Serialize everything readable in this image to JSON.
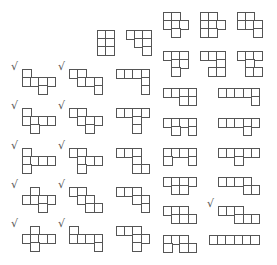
{
  "cell_size": 9.5,
  "line_color": "#555555",
  "check_glyph": "√",
  "pieces": [
    {
      "x": 22,
      "y": 69,
      "check": true,
      "cells": [
        [
          0,
          0
        ],
        [
          0,
          1
        ],
        [
          1,
          1
        ],
        [
          2,
          1
        ],
        [
          3,
          1
        ],
        [
          2,
          2
        ]
      ]
    },
    {
      "x": 22,
      "y": 108,
      "check": true,
      "cells": [
        [
          0,
          0
        ],
        [
          0,
          1
        ],
        [
          1,
          1
        ],
        [
          2,
          1
        ],
        [
          3,
          1
        ],
        [
          1,
          2
        ]
      ]
    },
    {
      "x": 22,
      "y": 148,
      "check": true,
      "cells": [
        [
          0,
          0
        ],
        [
          0,
          1
        ],
        [
          1,
          1
        ],
        [
          2,
          1
        ],
        [
          3,
          1
        ],
        [
          0,
          2
        ]
      ]
    },
    {
      "x": 22,
      "y": 187,
      "check": true,
      "cells": [
        [
          1,
          0
        ],
        [
          0,
          1
        ],
        [
          1,
          1
        ],
        [
          2,
          1
        ],
        [
          3,
          1
        ],
        [
          2,
          2
        ]
      ]
    },
    {
      "x": 22,
      "y": 226,
      "check": true,
      "cells": [
        [
          1,
          0
        ],
        [
          0,
          1
        ],
        [
          1,
          1
        ],
        [
          2,
          1
        ],
        [
          3,
          1
        ],
        [
          1,
          2
        ]
      ]
    },
    {
      "x": 69,
      "y": 69,
      "check": true,
      "cells": [
        [
          0,
          0
        ],
        [
          1,
          0
        ],
        [
          1,
          1
        ],
        [
          2,
          1
        ],
        [
          3,
          1
        ],
        [
          3,
          2
        ]
      ]
    },
    {
      "x": 69,
      "y": 108,
      "check": true,
      "cells": [
        [
          0,
          0
        ],
        [
          1,
          0
        ],
        [
          1,
          1
        ],
        [
          2,
          1
        ],
        [
          3,
          1
        ],
        [
          2,
          2
        ]
      ]
    },
    {
      "x": 69,
      "y": 148,
      "check": true,
      "cells": [
        [
          0,
          0
        ],
        [
          1,
          0
        ],
        [
          1,
          1
        ],
        [
          2,
          1
        ],
        [
          3,
          1
        ],
        [
          1,
          2
        ]
      ]
    },
    {
      "x": 69,
      "y": 187,
      "check": true,
      "cells": [
        [
          0,
          0
        ],
        [
          1,
          0
        ],
        [
          1,
          1
        ],
        [
          2,
          1
        ],
        [
          2,
          2
        ],
        [
          3,
          2
        ]
      ]
    },
    {
      "x": 69,
      "y": 226,
      "check": true,
      "cells": [
        [
          0,
          0
        ],
        [
          0,
          1
        ],
        [
          1,
          1
        ],
        [
          2,
          1
        ],
        [
          3,
          1
        ],
        [
          3,
          2
        ]
      ]
    },
    {
      "x": 97,
      "y": 30,
      "check": false,
      "cells": [
        [
          0,
          0
        ],
        [
          1,
          0
        ],
        [
          0,
          1
        ],
        [
          1,
          1
        ],
        [
          0,
          2
        ],
        [
          1,
          2
        ]
      ]
    },
    {
      "x": 126,
      "y": 30,
      "check": false,
      "cells": [
        [
          0,
          0
        ],
        [
          1,
          0
        ],
        [
          2,
          0
        ],
        [
          1,
          1
        ],
        [
          2,
          1
        ],
        [
          2,
          2
        ]
      ]
    },
    {
      "x": 116,
      "y": 69,
      "check": false,
      "cells": [
        [
          0,
          0
        ],
        [
          1,
          0
        ],
        [
          2,
          0
        ],
        [
          3,
          0
        ],
        [
          3,
          1
        ],
        [
          3,
          2
        ]
      ]
    },
    {
      "x": 116,
      "y": 108,
      "check": false,
      "cells": [
        [
          0,
          0
        ],
        [
          1,
          0
        ],
        [
          2,
          0
        ],
        [
          3,
          0
        ],
        [
          2,
          1
        ],
        [
          2,
          2
        ]
      ]
    },
    {
      "x": 116,
      "y": 148,
      "check": false,
      "cells": [
        [
          0,
          0
        ],
        [
          1,
          0
        ],
        [
          2,
          0
        ],
        [
          2,
          1
        ],
        [
          2,
          2
        ],
        [
          3,
          2
        ]
      ]
    },
    {
      "x": 116,
      "y": 187,
      "check": false,
      "cells": [
        [
          0,
          0
        ],
        [
          1,
          0
        ],
        [
          2,
          0
        ],
        [
          2,
          1
        ],
        [
          3,
          1
        ],
        [
          3,
          2
        ]
      ]
    },
    {
      "x": 116,
      "y": 226,
      "check": false,
      "cells": [
        [
          0,
          0
        ],
        [
          1,
          0
        ],
        [
          2,
          0
        ],
        [
          2,
          1
        ],
        [
          3,
          1
        ],
        [
          2,
          2
        ]
      ]
    },
    {
      "x": 163,
      "y": 12,
      "check": false,
      "cells": [
        [
          0,
          0
        ],
        [
          1,
          0
        ],
        [
          0,
          1
        ],
        [
          1,
          1
        ],
        [
          2,
          1
        ],
        [
          1,
          2
        ]
      ]
    },
    {
      "x": 163,
      "y": 51,
      "check": false,
      "cells": [
        [
          0,
          0
        ],
        [
          1,
          0
        ],
        [
          2,
          0
        ],
        [
          1,
          1
        ],
        [
          2,
          1
        ],
        [
          1,
          2
        ]
      ]
    },
    {
      "x": 163,
      "y": 88,
      "check": false,
      "cells": [
        [
          0,
          0
        ],
        [
          1,
          0
        ],
        [
          2,
          0
        ],
        [
          3,
          0
        ],
        [
          2,
          1
        ],
        [
          3,
          1
        ]
      ]
    },
    {
      "x": 163,
      "y": 118,
      "check": false,
      "cells": [
        [
          0,
          0
        ],
        [
          1,
          0
        ],
        [
          2,
          0
        ],
        [
          3,
          0
        ],
        [
          1,
          1
        ],
        [
          3,
          1
        ]
      ]
    },
    {
      "x": 163,
      "y": 148,
      "check": false,
      "cells": [
        [
          0,
          0
        ],
        [
          1,
          0
        ],
        [
          2,
          0
        ],
        [
          3,
          0
        ],
        [
          0,
          1
        ],
        [
          3,
          1
        ]
      ]
    },
    {
      "x": 163,
      "y": 177,
      "check": false,
      "cells": [
        [
          0,
          0
        ],
        [
          1,
          0
        ],
        [
          2,
          0
        ],
        [
          3,
          0
        ],
        [
          1,
          1
        ],
        [
          2,
          1
        ]
      ]
    },
    {
      "x": 163,
      "y": 206,
      "check": false,
      "cells": [
        [
          0,
          0
        ],
        [
          1,
          0
        ],
        [
          2,
          0
        ],
        [
          1,
          1
        ],
        [
          2,
          1
        ],
        [
          3,
          1
        ]
      ]
    },
    {
      "x": 163,
      "y": 235,
      "check": false,
      "cells": [
        [
          0,
          0
        ],
        [
          1,
          0
        ],
        [
          2,
          0
        ],
        [
          0,
          1
        ],
        [
          2,
          1
        ],
        [
          3,
          1
        ]
      ]
    },
    {
      "x": 200,
      "y": 12,
      "check": false,
      "cells": [
        [
          0,
          0
        ],
        [
          1,
          0
        ],
        [
          0,
          1
        ],
        [
          1,
          1
        ],
        [
          2,
          1
        ],
        [
          0,
          2
        ],
        [
          1,
          2
        ]
      ]
    },
    {
      "x": 237,
      "y": 12,
      "check": false,
      "cells": [
        [
          0,
          0
        ],
        [
          1,
          0
        ],
        [
          0,
          1
        ],
        [
          1,
          1
        ],
        [
          2,
          1
        ],
        [
          2,
          2
        ]
      ]
    },
    {
      "x": 200,
      "y": 51,
      "check": false,
      "cells": [
        [
          0,
          0
        ],
        [
          1,
          0
        ],
        [
          2,
          0
        ],
        [
          2,
          1
        ],
        [
          1,
          2
        ],
        [
          2,
          2
        ]
      ]
    },
    {
      "x": 237,
      "y": 51,
      "check": false,
      "cells": [
        [
          0,
          0
        ],
        [
          1,
          0
        ],
        [
          2,
          0
        ],
        [
          1,
          1
        ],
        [
          1,
          2
        ],
        [
          2,
          2
        ]
      ]
    },
    {
      "x": 218,
      "y": 88,
      "check": false,
      "cells": [
        [
          0,
          0
        ],
        [
          1,
          0
        ],
        [
          2,
          0
        ],
        [
          3,
          0
        ],
        [
          4,
          0
        ],
        [
          4,
          1
        ]
      ]
    },
    {
      "x": 218,
      "y": 118,
      "check": false,
      "cells": [
        [
          0,
          0
        ],
        [
          1,
          0
        ],
        [
          2,
          0
        ],
        [
          3,
          0
        ],
        [
          4,
          0
        ],
        [
          3,
          1
        ]
      ]
    },
    {
      "x": 218,
      "y": 148,
      "check": false,
      "cells": [
        [
          0,
          0
        ],
        [
          1,
          0
        ],
        [
          2,
          0
        ],
        [
          3,
          0
        ],
        [
          4,
          0
        ],
        [
          2,
          1
        ]
      ]
    },
    {
      "x": 218,
      "y": 177,
      "check": false,
      "cells": [
        [
          0,
          0
        ],
        [
          1,
          0
        ],
        [
          2,
          0
        ],
        [
          3,
          0
        ],
        [
          3,
          1
        ],
        [
          4,
          1
        ]
      ]
    },
    {
      "x": 218,
      "y": 206,
      "check": true,
      "cells": [
        [
          0,
          0
        ],
        [
          1,
          0
        ],
        [
          2,
          0
        ],
        [
          2,
          1
        ],
        [
          3,
          1
        ],
        [
          4,
          1
        ]
      ]
    },
    {
      "x": 209,
      "y": 235,
      "check": false,
      "cells": [
        [
          0,
          0
        ],
        [
          1,
          0
        ],
        [
          2,
          0
        ],
        [
          3,
          0
        ],
        [
          4,
          0
        ],
        [
          5,
          0
        ]
      ]
    }
  ]
}
